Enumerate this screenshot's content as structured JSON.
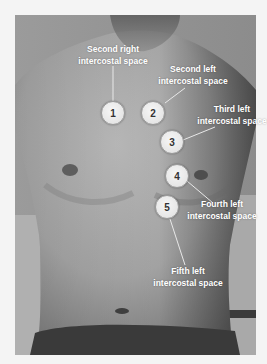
{
  "figure": {
    "markers": [
      {
        "number": "1",
        "line1": "Second right",
        "line2": "intercostal space"
      },
      {
        "number": "2",
        "line1": "Second left",
        "line2": "intercostal space"
      },
      {
        "number": "3",
        "line1": "Third left",
        "line2": "intercostal space"
      },
      {
        "number": "4",
        "line1": "Fourth left",
        "line2": "intercostal space"
      },
      {
        "number": "5",
        "line1": "Fifth left",
        "line2": "intercostal space"
      }
    ],
    "colors": {
      "label_text": "#ffffff",
      "marker_fill": "#eeeeee",
      "marker_border": "#9a9a9a",
      "marker_text": "#333333",
      "leader_line": "#e8e8e8"
    }
  }
}
